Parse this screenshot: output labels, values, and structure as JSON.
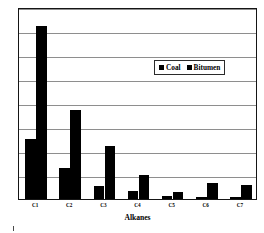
{
  "chart_data": {
    "type": "bar",
    "title": "",
    "xlabel": "Alkanes",
    "ylabel": "Relative Partial Pressure Per Gram",
    "categories": [
      "C1",
      "C2",
      "C3",
      "C4",
      "C5",
      "C6",
      "C7"
    ],
    "series": [
      {
        "name": "Coal",
        "color": "#000000",
        "values": [
          2.5,
          1.3,
          0.55,
          0.35,
          0.12,
          0.08,
          0.07
        ]
      },
      {
        "name": "Bitumen",
        "color": "#000000",
        "values": [
          7.2,
          3.7,
          2.2,
          1.0,
          0.3,
          0.65,
          0.6
        ]
      }
    ],
    "ylim": [
      0,
      8
    ],
    "yticks": [
      0,
      1,
      2,
      3,
      4,
      5,
      6,
      7,
      8
    ],
    "y_tick_labels_shown": false,
    "grid": "horizontal",
    "legend_position": "upper-right-inside",
    "legend_entries": [
      "Coal",
      "Bitumen"
    ]
  },
  "legend": {
    "coal_label": "Coal",
    "bitumen_label": "Bitumen"
  },
  "axes": {
    "x_title": "Alkanes",
    "y_title": "Relative Partial Pressure Per Gram"
  }
}
